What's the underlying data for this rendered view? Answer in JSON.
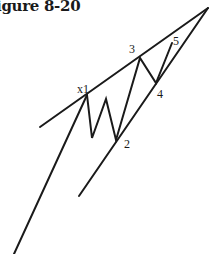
{
  "figure": {
    "title": "igure 8-20"
  },
  "colors": {
    "ink": "#1a1a1a",
    "background": "#ffffff"
  },
  "labels": {
    "x1": "x1",
    "w2": "2",
    "w3": "3",
    "w4": "4",
    "w5": "5"
  },
  "geometry": {
    "upper_trendline": [
      [
        40,
        127
      ],
      [
        208,
        8
      ]
    ],
    "lower_trendline": [
      [
        79,
        196
      ],
      [
        208,
        8
      ]
    ],
    "approach_leg": [
      [
        14,
        254
      ],
      [
        87,
        95
      ]
    ],
    "wave_path": [
      [
        87,
        95
      ],
      [
        92,
        138
      ],
      [
        106,
        99
      ],
      [
        116,
        140
      ],
      [
        140,
        58
      ],
      [
        156,
        83
      ],
      [
        172,
        43
      ]
    ]
  }
}
